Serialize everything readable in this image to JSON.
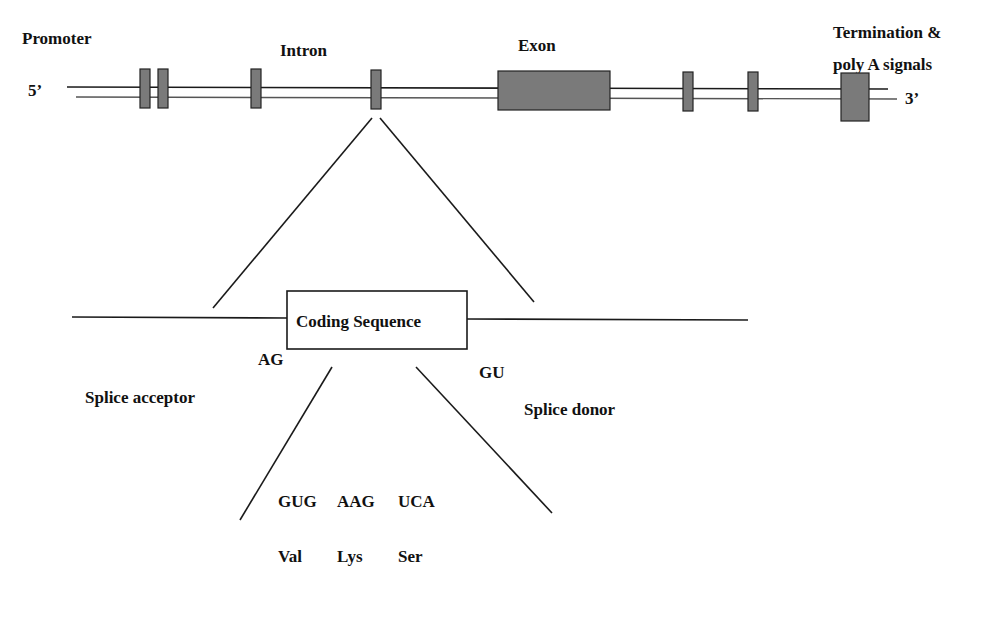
{
  "gene_structure": {
    "labels": {
      "promoter": "Promoter",
      "intron": "Intron",
      "exon": "Exon",
      "termination_line1": "Termination &",
      "termination_line2": "poly A signals",
      "five_prime": "5’",
      "three_prime": "3’"
    },
    "colors": {
      "exon_fill": "#7a7a7a",
      "line": "#1a1a1a"
    }
  },
  "expanded_region": {
    "coding_sequence_label": "Coding Sequence",
    "acceptor_site": "AG",
    "donor_site": "GU",
    "splice_acceptor_label": "Splice acceptor",
    "splice_donor_label": "Splice donor"
  },
  "translation": {
    "codons": [
      "GUG",
      "AAG",
      "UCA"
    ],
    "amino_acids": [
      "Val",
      "Lys",
      "Ser"
    ]
  }
}
